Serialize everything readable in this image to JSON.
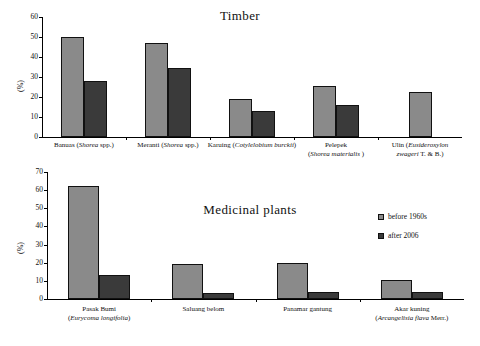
{
  "chart_data": [
    {
      "type": "bar",
      "title": "Timber",
      "xlabel": "",
      "ylabel": "(%)",
      "ylim": [
        0,
        60
      ],
      "yticks": [
        0,
        10,
        20,
        30,
        40,
        50,
        60
      ],
      "grid": false,
      "legend_position": "none",
      "categories": [
        "Banuas (Shorea spp.)",
        "Meranti (Shorea spp.)",
        "Karuing (Cotylelobium burckii)",
        "Pelepek (Shorea materialis )",
        "Ulin (Eusideroxylon zwageri T. & B.)"
      ],
      "category_parts": [
        {
          "common": "Banuas (",
          "latin": "Shorea",
          "tail": " spp.)",
          "line2": ""
        },
        {
          "common": "Meranti (",
          "latin": "Shorea",
          "tail": " spp.)",
          "line2": ""
        },
        {
          "common": "Karuing (",
          "latin": "Cotylelobium burckii",
          "tail": ")",
          "line2": ""
        },
        {
          "common": "Pelepek",
          "latin": "",
          "tail": "",
          "line2_pre": "(",
          "line2_latin": "Shorea materialis",
          "line2_post": " )"
        },
        {
          "common": "Ulin (",
          "latin": "Eusideroxylon",
          "tail": "",
          "line2_pre": "",
          "line2_latin": "zwageri",
          "line2_post": " T. & B.)"
        }
      ],
      "series": [
        {
          "name": "before 1960s",
          "color": "#8a8a8a",
          "values": [
            50.0,
            47.0,
            19.0,
            25.5,
            22.5
          ]
        },
        {
          "name": "after 2006",
          "color": "#3a3a3a",
          "values": [
            28.0,
            34.5,
            13.0,
            16.0,
            null
          ]
        }
      ]
    },
    {
      "type": "bar",
      "title": "Medicinal plants",
      "xlabel": "",
      "ylabel": "(%)",
      "ylim": [
        0,
        70
      ],
      "yticks": [
        0,
        10,
        20,
        30,
        40,
        50,
        60,
        70
      ],
      "grid": false,
      "legend_position": "upper right",
      "categories": [
        "Pasak Bumi (Eurycoma longifolia)",
        "Saluang belom",
        "Panamar gantung",
        "Akar kuning (Arcangelisia flava Merr.)"
      ],
      "category_parts": [
        {
          "common": "Pasak Bumi",
          "line2_pre": "(",
          "line2_latin": "Eurycoma longifolia",
          "line2_post": ")"
        },
        {
          "common": "Saluang belom",
          "line2_pre": "",
          "line2_latin": "",
          "line2_post": ""
        },
        {
          "common": "Panamar gantung",
          "line2_pre": "",
          "line2_latin": "",
          "line2_post": ""
        },
        {
          "common": "Akar kuning",
          "line2_pre": "(",
          "line2_latin": "Arcangelisia flava",
          "line2_post": " Merr.)"
        }
      ],
      "series": [
        {
          "name": "before 1960s",
          "color": "#8a8a8a",
          "values": [
            62.5,
            19.5,
            19.7,
            10.2
          ]
        },
        {
          "name": "after 2006",
          "color": "#3a3a3a",
          "values": [
            13.0,
            3.3,
            3.6,
            3.8
          ]
        }
      ]
    }
  ],
  "timber": {
    "title": "Timber",
    "ylabel": "(%)",
    "yticks": [
      "60",
      "50",
      "40",
      "30",
      "20",
      "10",
      "0"
    ],
    "labels": [
      {
        "line1_pre": "Banuas (",
        "line1_em": "Shorea",
        "line1_post": " spp.)",
        "line2_pre": "",
        "line2_em": "",
        "line2_post": ""
      },
      {
        "line1_pre": "Meranti (",
        "line1_em": "Shorea",
        "line1_post": " spp.)",
        "line2_pre": "",
        "line2_em": "",
        "line2_post": ""
      },
      {
        "line1_pre": "Karuing (",
        "line1_em": "Cotylelobium burckii",
        "line1_post": ")",
        "line2_pre": "",
        "line2_em": "",
        "line2_post": ""
      },
      {
        "line1_pre": "Pelepek",
        "line1_em": "",
        "line1_post": "",
        "line2_pre": "(",
        "line2_em": "Shorea materialis",
        "line2_post": " )"
      },
      {
        "line1_pre": "Ulin (",
        "line1_em": "Eusideroxylon",
        "line1_post": "",
        "line2_pre": "",
        "line2_em": "zwageri",
        "line2_post": " T. & B.)"
      }
    ]
  },
  "medicinal": {
    "title": "Medicinal plants",
    "ylabel": "(%)",
    "yticks": [
      "70",
      "60",
      "50",
      "40",
      "30",
      "20",
      "10",
      "0"
    ],
    "labels": [
      {
        "line1_pre": "Pasak Bumi",
        "line1_em": "",
        "line1_post": "",
        "line2_pre": "(",
        "line2_em": "Eurycoma longifolia",
        "line2_post": ")"
      },
      {
        "line1_pre": "Saluang belom",
        "line1_em": "",
        "line1_post": "",
        "line2_pre": "",
        "line2_em": "",
        "line2_post": ""
      },
      {
        "line1_pre": "Panamar gantung",
        "line1_em": "",
        "line1_post": "",
        "line2_pre": "",
        "line2_em": "",
        "line2_post": ""
      },
      {
        "line1_pre": "Akar kuning",
        "line1_em": "",
        "line1_post": "",
        "line2_pre": "(",
        "line2_em": "Arcangelisia flava",
        "line2_post": " Merr.)"
      }
    ],
    "legend": {
      "before_label": "before 1960s",
      "after_label": "after 2006"
    }
  },
  "colors": {
    "before": "#8a8a8a",
    "after": "#3a3a3a",
    "axis": "#000000",
    "background": "#ffffff"
  }
}
